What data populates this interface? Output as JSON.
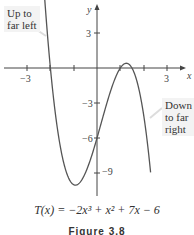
{
  "chart_data": {
    "type": "line",
    "title": "",
    "function": "T(x) = -2x^3 + x^2 + 7x - 6",
    "xlabel": "x",
    "ylabel": "y",
    "xlim": [
      -4,
      4
    ],
    "ylim": [
      -11.5,
      5.5
    ],
    "x_ticks": [
      -3,
      -2,
      -1,
      1,
      2,
      3
    ],
    "x_tick_labels": {
      "-3": "−3",
      "3": "3"
    },
    "y_ticks": [
      3,
      -3,
      -6,
      -9
    ],
    "y_tick_labels": {
      "3": "3",
      "-3": "−3",
      "-6": "−6",
      "-9": "−9"
    },
    "grid": false,
    "series": [
      {
        "name": "T(x)",
        "color": "#555555",
        "x": [
          -2.4,
          -2.0,
          -1.5,
          -1.0,
          -0.85,
          -0.5,
          0.0,
          0.5,
          1.0,
          1.2,
          1.5,
          2.0,
          2.3
        ],
        "y": [
          12.2,
          0.0,
          -7.5,
          -10.0,
          -10.1,
          -9.0,
          -6.0,
          -2.5,
          0.0,
          0.1,
          0.0,
          -4.0,
          -9.1
        ]
      }
    ],
    "annotations": [
      {
        "text": "Up to far left",
        "lines": [
          "Up to",
          "far left"
        ],
        "points_to": "left branch"
      },
      {
        "text": "Down to far right",
        "lines": [
          "Down",
          "to far",
          "right"
        ],
        "points_to": "right branch"
      }
    ],
    "roots": [
      -2,
      1,
      1.5
    ],
    "y_intercept": -6
  },
  "labels": {
    "x_axis": "x",
    "y_axis": "y",
    "callout_left": [
      "Up to",
      "far left"
    ],
    "callout_right": [
      "Down",
      "to far",
      "right"
    ],
    "formula": "T(x) = −2x³ + x² + 7x − 6",
    "figure": "Figure 3.8"
  }
}
